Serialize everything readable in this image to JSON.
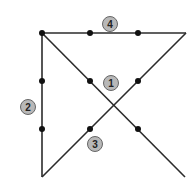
{
  "diagram": {
    "type": "nine-dots-puzzle-solution",
    "colors": {
      "line": "#2b2b2b",
      "dot": "#111111",
      "badge_fill": "#b8b8b8",
      "badge_stroke": "#666666",
      "badge_text": "#222222"
    },
    "dots": [
      {
        "x": 42,
        "y": 33
      },
      {
        "x": 90,
        "y": 33
      },
      {
        "x": 138,
        "y": 33
      },
      {
        "x": 42,
        "y": 81
      },
      {
        "x": 90,
        "y": 81
      },
      {
        "x": 138,
        "y": 81
      },
      {
        "x": 42,
        "y": 129
      },
      {
        "x": 90,
        "y": 129
      },
      {
        "x": 138,
        "y": 129
      }
    ],
    "lines": [
      {
        "step": "1",
        "x1": 42,
        "y1": 33,
        "x2": 185,
        "y2": 177
      },
      {
        "step": "2",
        "x1": 42,
        "y1": 33,
        "x2": 42,
        "y2": 177
      },
      {
        "step": "3",
        "x1": 42,
        "y1": 177,
        "x2": 186,
        "y2": 33
      },
      {
        "step": "4",
        "x1": 42,
        "y1": 33,
        "x2": 186,
        "y2": 33
      }
    ],
    "badges": [
      {
        "label": "4",
        "cx": 110,
        "cy": 24
      },
      {
        "label": "1",
        "cx": 111,
        "cy": 83
      },
      {
        "label": "2",
        "cx": 28,
        "cy": 107
      },
      {
        "label": "3",
        "cx": 95,
        "cy": 144
      }
    ]
  }
}
